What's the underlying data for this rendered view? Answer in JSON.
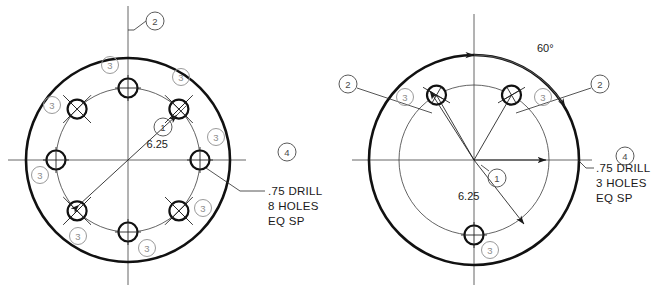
{
  "drawing": {
    "title": "Bolt Circle Hole Pattern Detail Views",
    "background_color": "#ffffff",
    "line_color": "#111111",
    "balloon_light_color": "#9a9a9a",
    "balloon_dark_color": "#5a5a5a"
  },
  "views": [
    {
      "id": "left-view",
      "name": "eight-hole-pattern",
      "center": {
        "x": 128,
        "y": 160
      },
      "outer_radius": 102,
      "bolt_circle_radius": 72,
      "hole_radius": 9.5,
      "hole_count": 8,
      "hole_angles_deg": [
        90,
        45,
        0,
        315,
        270,
        225,
        180,
        135
      ],
      "dimension": {
        "label": "6.25",
        "text_x": 168,
        "text_y": 148,
        "type": "diameter"
      },
      "note": {
        "line1": ".75 DRILL",
        "line2": "8 HOLES",
        "line3": "EQ SP",
        "x": 268,
        "y_start": 172
      },
      "balloons": [
        {
          "id": "1",
          "shade": "dark",
          "cx": 163,
          "cy": 127,
          "r": 9
        },
        {
          "id": "2",
          "shade": "dark",
          "cx": 155,
          "cy": 21,
          "r": 9
        },
        {
          "id": "4",
          "shade": "dark",
          "cx": 287,
          "cy": 152,
          "r": 9
        },
        {
          "id": "3",
          "shade": "light",
          "cx": 110,
          "cy": 65,
          "r": 8.5
        },
        {
          "id": "3",
          "shade": "light",
          "cx": 181,
          "cy": 77,
          "r": 8.5
        },
        {
          "id": "3",
          "shade": "light",
          "cx": 216,
          "cy": 137,
          "r": 8.5
        },
        {
          "id": "3",
          "shade": "light",
          "cx": 203,
          "cy": 208,
          "r": 8.5
        },
        {
          "id": "3",
          "shade": "light",
          "cx": 147,
          "cy": 248,
          "r": 8.5
        },
        {
          "id": "3",
          "shade": "light",
          "cx": 78,
          "cy": 236,
          "r": 8.5
        },
        {
          "id": "3",
          "shade": "light",
          "cx": 40,
          "cy": 175,
          "r": 8.5
        },
        {
          "id": "3",
          "shade": "light",
          "cx": 52,
          "cy": 105,
          "r": 8.5
        }
      ]
    },
    {
      "id": "right-view",
      "name": "three-hole-pattern",
      "center": {
        "x": 474,
        "y": 160
      },
      "outer_radius": 105,
      "bolt_circle_radius": 75,
      "hole_radius": 9.5,
      "hole_count": 3,
      "hole_angles_deg": [
        60,
        120,
        270
      ],
      "dimension": {
        "label": "6.25",
        "text_x": 475,
        "text_y": 197,
        "type": "diameter"
      },
      "angle_dimension": {
        "label": "60°",
        "value_deg": 60,
        "text_x": 537,
        "text_y": 48
      },
      "note": {
        "line1": ".75 DRILL",
        "line2": "3 HOLES",
        "line3": "EQ SP",
        "x": 596,
        "y_start": 172
      },
      "balloons": [
        {
          "id": "1",
          "shade": "dark",
          "cx": 497,
          "cy": 178,
          "r": 9
        },
        {
          "id": "2",
          "shade": "dark",
          "cx": 348,
          "cy": 84,
          "r": 9
        },
        {
          "id": "2",
          "shade": "dark",
          "cx": 600,
          "cy": 84,
          "r": 9
        },
        {
          "id": "4",
          "shade": "dark",
          "cx": 625,
          "cy": 156,
          "r": 9
        },
        {
          "id": "3",
          "shade": "light",
          "cx": 405,
          "cy": 97,
          "r": 8.5
        },
        {
          "id": "3",
          "shade": "light",
          "cx": 543,
          "cy": 97,
          "r": 8.5
        },
        {
          "id": "3",
          "shade": "light",
          "cx": 490,
          "cy": 250,
          "r": 8.5
        }
      ]
    }
  ]
}
